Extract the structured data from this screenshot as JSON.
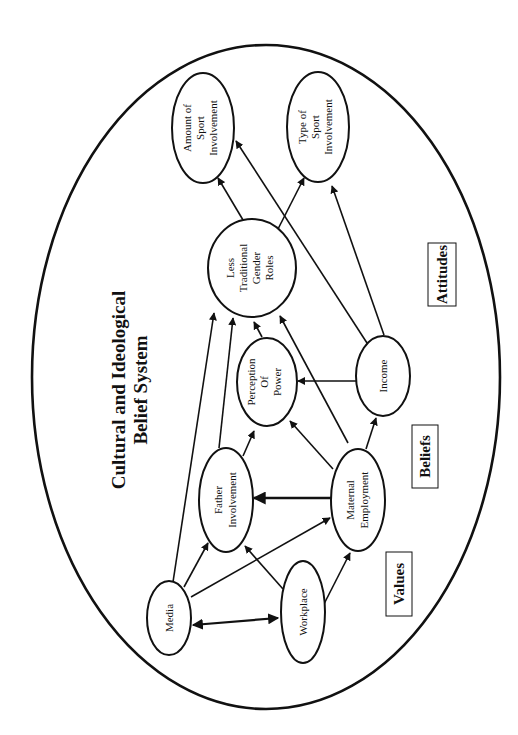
{
  "diagram": {
    "title_lines": [
      "Cultural and Ideological",
      "Belief System"
    ],
    "orientation": "rotated 90 degrees counter-clockwise",
    "categories": {
      "attitudes": "Attitudes",
      "beliefs": "Beliefs",
      "values": "Values"
    },
    "nodes": {
      "amount": {
        "lines": [
          "Amount of",
          "Sport",
          "Involvement"
        ]
      },
      "type": {
        "lines": [
          "Type of",
          "Sport",
          "Involvement"
        ]
      },
      "gender": {
        "lines": [
          "Less",
          "Traditional",
          "Gender",
          "Roles"
        ]
      },
      "power": {
        "lines": [
          "Perception",
          "Of",
          "Power"
        ]
      },
      "income": {
        "lines": [
          "Income"
        ]
      },
      "father": {
        "lines": [
          "Father",
          "Involvement"
        ]
      },
      "maternal": {
        "lines": [
          "Maternal",
          "Employment"
        ]
      },
      "media": {
        "lines": [
          "Media"
        ]
      },
      "workplace": {
        "lines": [
          "Workplace"
        ]
      }
    },
    "edges": [
      {
        "from": "gender",
        "to": "amount"
      },
      {
        "from": "gender",
        "to": "type"
      },
      {
        "from": "income",
        "to": "amount"
      },
      {
        "from": "income",
        "to": "type"
      },
      {
        "from": "income",
        "to": "power"
      },
      {
        "from": "power",
        "to": "gender"
      },
      {
        "from": "maternal",
        "to": "gender"
      },
      {
        "from": "maternal",
        "to": "power"
      },
      {
        "from": "maternal",
        "to": "income"
      },
      {
        "from": "maternal",
        "to": "father"
      },
      {
        "from": "father",
        "to": "gender"
      },
      {
        "from": "father",
        "to": "power"
      },
      {
        "from": "media",
        "to": "gender"
      },
      {
        "from": "media",
        "to": "father"
      },
      {
        "from": "media",
        "to": "maternal"
      },
      {
        "from": "media",
        "to": "workplace",
        "bidirectional": true
      },
      {
        "from": "workplace",
        "to": "father"
      },
      {
        "from": "workplace",
        "to": "maternal"
      }
    ]
  }
}
